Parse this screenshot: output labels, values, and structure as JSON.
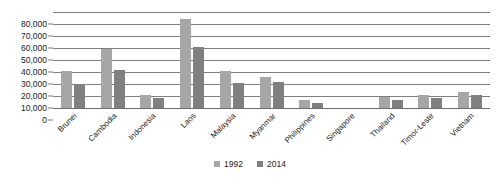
{
  "chart_data": {
    "type": "bar",
    "title": "",
    "xlabel": "",
    "ylabel": "",
    "ylim": [
      0,
      80000
    ],
    "yticks": [
      0,
      10000,
      20000,
      30000,
      40000,
      50000,
      60000,
      70000,
      80000
    ],
    "ytick_labels": [
      "0",
      "10,000",
      "20,000",
      "30,000",
      "40,000",
      "50,000",
      "60,000",
      "70,000",
      "80,000"
    ],
    "grid": true,
    "legend_position": "bottom",
    "categories": [
      "Brunei",
      "Cambodia",
      "Indonesia",
      "Laos",
      "Malaysia",
      "Myanmar",
      "Philippines",
      "Singapore",
      "Thailand",
      "Timor-Leste",
      "Vietnam"
    ],
    "series": [
      {
        "name": "1992",
        "color": "#a6a6a6",
        "values": [
          31000,
          49500,
          11000,
          74000,
          30500,
          26000,
          6500,
          0,
          9000,
          11000,
          13000
        ]
      },
      {
        "name": "2014",
        "color": "#808080",
        "values": [
          20000,
          32000,
          8500,
          51000,
          20500,
          22000,
          4500,
          0,
          7000,
          8500,
          11000
        ]
      }
    ]
  },
  "legend": {
    "items": [
      {
        "label": "1992",
        "color": "#a6a6a6"
      },
      {
        "label": "2014",
        "color": "#808080"
      }
    ]
  }
}
